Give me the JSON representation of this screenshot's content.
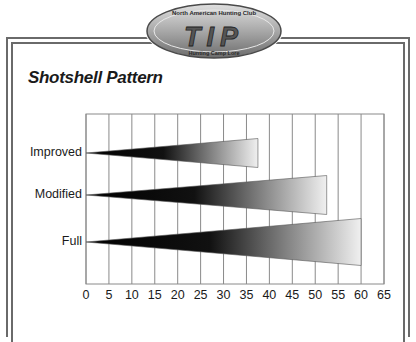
{
  "logo": {
    "top_text": "North American Hunting Club",
    "main_text": "TIP",
    "bottom_text": "Hunting Camp Lore"
  },
  "title": "Shotshell Pattern",
  "chart_data": {
    "type": "bar",
    "subtype": "tapered-horizontal-gradient",
    "title": "Shotshell Pattern",
    "categories": [
      "Improved",
      "Modified",
      "Full"
    ],
    "values": [
      37.5,
      52.5,
      60
    ],
    "xlabel": "",
    "ylabel": "",
    "xlim": [
      0,
      65
    ],
    "x_ticks": [
      "0",
      "5",
      "10",
      "15",
      "20",
      "25",
      "30",
      "35",
      "40",
      "45",
      "50",
      "55",
      "60",
      "65"
    ],
    "grid": true,
    "legend": null
  },
  "colors": {
    "frame": "#6a6a6a",
    "grid": "#8a8a8a",
    "bar_start": "#000000",
    "bar_end": "#f0f0f0",
    "logo_fill": "#9a9a9a"
  }
}
